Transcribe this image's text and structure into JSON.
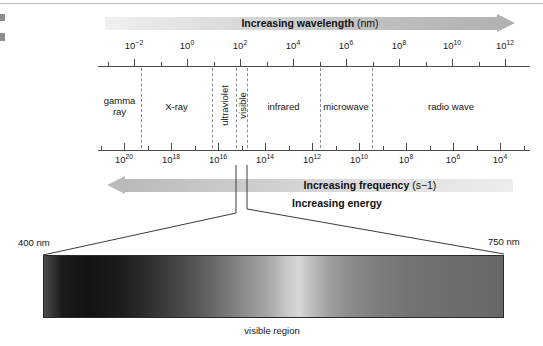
{
  "figure": {
    "background": "#ffffff"
  },
  "top_arrow": {
    "label": "Increasing wavelength",
    "unit": "(nm)",
    "direction": "right"
  },
  "bottom_arrow": {
    "label": "Increasing frequency",
    "unit": "(s−1)",
    "direction": "left"
  },
  "energy_note": {
    "label": "Increasing energy"
  },
  "wavelength_axis": {
    "name": "wavelength-axis",
    "unit": "nm",
    "ticks": [
      {
        "base": "10",
        "exp": "−2"
      },
      {
        "base": "10",
        "exp": "0"
      },
      {
        "base": "10",
        "exp": "2"
      },
      {
        "base": "10",
        "exp": "4"
      },
      {
        "base": "10",
        "exp": "6"
      },
      {
        "base": "10",
        "exp": "8"
      },
      {
        "base": "10",
        "exp": "10"
      },
      {
        "base": "10",
        "exp": "12"
      }
    ]
  },
  "frequency_axis": {
    "name": "frequency-axis",
    "unit": "s−1",
    "ticks": [
      {
        "base": "10",
        "exp": "20"
      },
      {
        "base": "10",
        "exp": "18"
      },
      {
        "base": "10",
        "exp": "16"
      },
      {
        "base": "10",
        "exp": "14"
      },
      {
        "base": "10",
        "exp": "12"
      },
      {
        "base": "10",
        "exp": "10"
      },
      {
        "base": "10",
        "exp": "8"
      },
      {
        "base": "10",
        "exp": "6"
      },
      {
        "base": "10",
        "exp": "4"
      }
    ]
  },
  "regions": [
    {
      "name": "gamma-ray",
      "line1": "gamma",
      "line2": "ray",
      "orientation": "horizontal"
    },
    {
      "name": "x-ray",
      "line1": "X-ray",
      "line2": "",
      "orientation": "horizontal"
    },
    {
      "name": "ultraviolet",
      "line1": "ultraviolet",
      "line2": "",
      "orientation": "vertical"
    },
    {
      "name": "visible",
      "line1": "visible",
      "line2": "",
      "orientation": "vertical"
    },
    {
      "name": "infrared",
      "line1": "infrared",
      "line2": "",
      "orientation": "horizontal"
    },
    {
      "name": "microwave",
      "line1": "microwave",
      "line2": "",
      "orientation": "horizontal"
    },
    {
      "name": "radio-wave",
      "line1": "radio wave",
      "line2": "",
      "orientation": "horizontal"
    }
  ],
  "visible_strip": {
    "left_label": "400 nm",
    "right_label": "750 nm",
    "caption": "visible region"
  },
  "chart_data": {
    "type": "bar",
    "xlabel": "Wavelength (nm) / Frequency (s−1)",
    "ylabel": "",
    "axes": [
      {
        "name": "wavelength",
        "unit": "nm",
        "scale": "log10",
        "direction": "increasing-right",
        "tick_exponents": [
          -2,
          0,
          2,
          4,
          6,
          8,
          10,
          12
        ],
        "minor_ticks_between": 1,
        "range_exponents": [
          -3,
          13
        ]
      },
      {
        "name": "frequency",
        "unit": "s^-1",
        "scale": "log10",
        "direction": "increasing-left",
        "tick_exponents": [
          20,
          18,
          16,
          14,
          12,
          10,
          8,
          6,
          4
        ],
        "minor_ticks_between": 1,
        "range_exponents": [
          21,
          3
        ]
      }
    ],
    "categories": [
      "gamma ray",
      "X-ray",
      "ultraviolet",
      "visible",
      "infrared",
      "microwave",
      "radio wave"
    ],
    "region_bounds_wavelength_nm_exponent": [
      {
        "name": "gamma ray",
        "start": -3,
        "end": -1.7
      },
      {
        "name": "X-ray",
        "start": -1.7,
        "end": 1.0
      },
      {
        "name": "ultraviolet",
        "start": 1.0,
        "end": 2.6
      },
      {
        "name": "visible",
        "start": 2.6,
        "end": 2.9
      },
      {
        "name": "infrared",
        "start": 2.9,
        "end": 6.0
      },
      {
        "name": "microwave",
        "start": 6.0,
        "end": 8.0
      },
      {
        "name": "radio wave",
        "start": 8.0,
        "end": 13.0
      }
    ],
    "visible_range_nm": [
      400,
      750
    ],
    "annotations": [
      "Increasing wavelength (nm)",
      "Increasing frequency (s−1)",
      "Increasing energy",
      "400 nm",
      "750 nm",
      "visible region"
    ],
    "grid": false,
    "legend": "none"
  }
}
